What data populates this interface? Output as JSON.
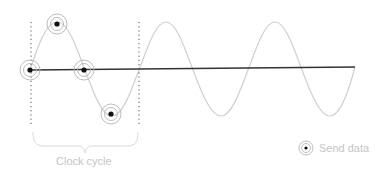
{
  "diagram": {
    "type": "sine wave sampling diagram",
    "clock_cycle_label": "Clock cycle",
    "legend": {
      "icon": "send-data-marker-icon",
      "label": "Send data"
    },
    "colors": {
      "wave": "#cfcfcf",
      "axis": "#333333",
      "marker_dot": "#111111",
      "marker_ring": "#b5b5b5",
      "label": "#c4c4c4",
      "dotted_guides": "#555555"
    },
    "sample_points": [
      {
        "name": "start",
        "x": 30,
        "y": 70
      },
      {
        "name": "peak",
        "x": 57,
        "y": 22
      },
      {
        "name": "zero-crossing",
        "x": 85,
        "y": 70
      },
      {
        "name": "trough",
        "x": 112,
        "y": 116
      }
    ]
  }
}
